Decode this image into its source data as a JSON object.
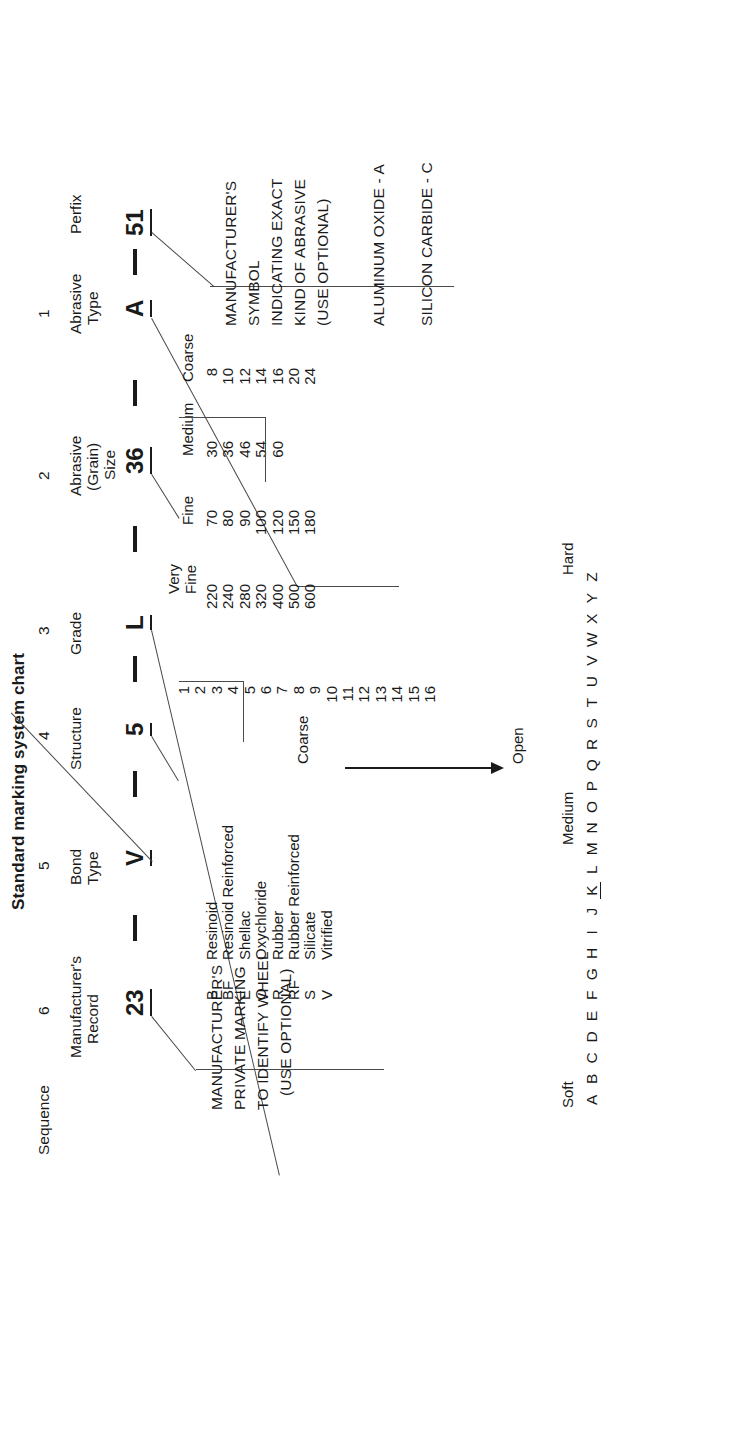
{
  "title": "Standard marking system chart",
  "row_labels": {
    "sequence": "Sequence"
  },
  "columns": [
    {
      "num": "",
      "header": "Perfix",
      "header2": "",
      "code": "51",
      "underline": true
    },
    {
      "num": "1",
      "header": "Abrasive",
      "header2": "Type",
      "code": "A",
      "underline": true
    },
    {
      "num": "2",
      "header": "Abrasive",
      "header2": "(Grain)",
      "header3": "Size",
      "code": "36",
      "underline": true
    },
    {
      "num": "3",
      "header": "Grade",
      "header2": "",
      "code": "L",
      "underline": true
    },
    {
      "num": "4",
      "header": "Structure",
      "header2": "",
      "code": "5",
      "underline": true
    },
    {
      "num": "5",
      "header": "Bond",
      "header2": "Type",
      "code": "V",
      "underline": true
    },
    {
      "num": "6",
      "header": "Manufacturer's",
      "header2": "Record",
      "code": "23",
      "underline": true
    }
  ],
  "separators": [
    "-",
    "-",
    "-",
    "-",
    "-",
    "-"
  ],
  "prefix_note": {
    "lines": [
      "MANUFACTURER'S",
      "SYMBOL",
      "INDICATING EXACT",
      "KIND OF ABRASIVE",
      "(USE OPTIONAL)"
    ]
  },
  "abrasive_type_note": {
    "lines": [
      "ALUMINUM OXIDE - A",
      "SILICON CARBIDE - C"
    ]
  },
  "grain_size": {
    "group_labels": [
      "Coarse",
      "Medium",
      "Fine",
      "Very",
      "Fine"
    ],
    "coarse": [
      "8",
      "10",
      "12",
      "14",
      "16",
      "20",
      "24"
    ],
    "medium": [
      "30",
      "36",
      "46",
      "54",
      "60"
    ],
    "fine": [
      "70",
      "80",
      "90",
      "100",
      "120",
      "150",
      "180"
    ],
    "very_fine": [
      "220",
      "240",
      "280",
      "320",
      "400",
      "500",
      "600"
    ]
  },
  "grade": {
    "scale_labels": [
      "Soft",
      "Medium",
      "Hard"
    ],
    "letters": [
      "A",
      "B",
      "C",
      "D",
      "E",
      "F",
      "G",
      "H",
      "I",
      "J",
      "K",
      "L",
      "M",
      "N",
      "O",
      "P",
      "Q",
      "R",
      "S",
      "T",
      "U",
      "V",
      "W",
      "X",
      "Y",
      "Z"
    ],
    "selected": "K"
  },
  "structure": {
    "left_label": "Coarse",
    "right_label": "Open",
    "values": [
      "1",
      "2",
      "3",
      "4",
      "5",
      "6",
      "7",
      "8",
      "9",
      "10",
      "11",
      "12",
      "13",
      "14",
      "15",
      "16"
    ]
  },
  "bond_type": {
    "rows": [
      {
        "code": "B",
        "name": "Resinoid"
      },
      {
        "code": "BF",
        "name": "Resinoid Reinforced"
      },
      {
        "code": "E",
        "name": "Shellac"
      },
      {
        "code": "O",
        "name": "Oxychloride"
      },
      {
        "code": "R",
        "name": "Rubber"
      },
      {
        "code": "RF",
        "name": "Rubber Reinforced"
      },
      {
        "code": "S",
        "name": "Silicate"
      },
      {
        "code": "V",
        "name": "Vitrified"
      }
    ]
  },
  "manufacturer_record_note": {
    "lines": [
      "MANUFACTURER'S",
      "PRIVATE MARKING",
      "TO IDENTIFY WHEEL",
      "(USE OPTIONAL)"
    ]
  }
}
